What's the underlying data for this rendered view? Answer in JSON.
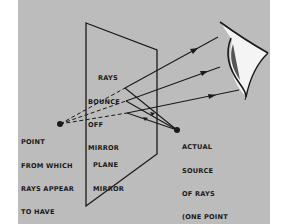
{
  "diagram": {
    "colors": {
      "background": "#ffffff",
      "panel": "#bcbcbc",
      "ink": "#1a1a1a",
      "eye_white": "#f4f4f4"
    },
    "labels": {
      "rays_bounce": [
        "RAYS",
        "BOUNCE",
        "OFF",
        "MIRROR"
      ],
      "image_point": [
        "POINT",
        "FROM WHICH",
        "RAYS APPEAR",
        "TO HAVE",
        "COME IS",
        "A POINT",
        "ON THE",
        "IMAGE"
      ],
      "plane_mirror": [
        "PLANE",
        "MIRROR"
      ],
      "actual_source": [
        "ACTUAL",
        "SOURCE",
        "OF RAYS",
        "(ONE POINT",
        "ON THE",
        "OBJECT)"
      ]
    },
    "nodes": [
      {
        "id": "image-point",
        "label": "Point from which rays appear to have come (image)"
      },
      {
        "id": "actual-source",
        "label": "Actual source of rays (object)"
      },
      {
        "id": "plane-mirror",
        "label": "Plane mirror"
      },
      {
        "id": "eye",
        "label": "Observer eye"
      }
    ],
    "edges": [
      {
        "from": "actual-source",
        "to": "plane-mirror",
        "count": 3,
        "style": "solid"
      },
      {
        "from": "plane-mirror",
        "to": "eye",
        "count": 3,
        "style": "solid-arrow"
      },
      {
        "from": "image-point",
        "to": "plane-mirror",
        "count": 3,
        "style": "dashed"
      }
    ]
  }
}
